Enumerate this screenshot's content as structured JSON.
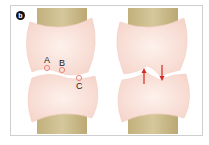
{
  "figure": {
    "panel_label": "b",
    "left_panel": {
      "description": "joint with articular surfaces, contact points marked",
      "points": [
        {
          "label": "A",
          "x": 47,
          "y": 68,
          "label_x": 44,
          "label_y": 56
        },
        {
          "label": "B",
          "x": 62,
          "y": 70,
          "label_x": 59,
          "label_y": 59
        },
        {
          "label": "C",
          "x": 79,
          "y": 78,
          "label_x": 76,
          "label_y": 82
        }
      ]
    },
    "right_panel": {
      "description": "joint under load, arrows showing compression",
      "arrows": [
        {
          "direction": "up",
          "x": 144,
          "y1": 84,
          "y2": 70
        },
        {
          "direction": "down",
          "x": 162,
          "y1": 65,
          "y2": 79
        }
      ]
    },
    "colors": {
      "bone_shaft": "#c9b887",
      "cartilage": "#fbe6e0",
      "marker": "#e8877a",
      "arrow": "#d42a1f",
      "frame": "#cfcfcf"
    }
  }
}
